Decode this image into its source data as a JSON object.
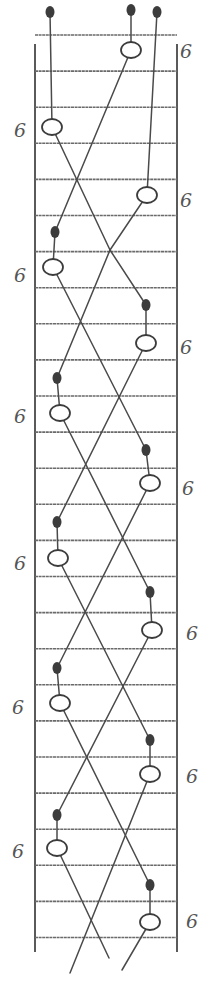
{
  "diagram": {
    "type": "ladder-crossing-diagram",
    "rung_count": 26,
    "marker_label": "6",
    "colors": {
      "ink": "#3c3c3c",
      "rail": "#5a5a5a",
      "background": "#ffffff"
    },
    "start_dots": 3,
    "stages": [
      {
        "side": "right",
        "label": "6"
      },
      {
        "side": "left",
        "label": "6"
      },
      {
        "side": "right",
        "label": "6"
      },
      {
        "side": "left",
        "label": "6"
      },
      {
        "side": "right",
        "label": "6"
      },
      {
        "side": "left",
        "label": "6"
      },
      {
        "side": "right",
        "label": "6"
      },
      {
        "side": "left",
        "label": "6"
      },
      {
        "side": "right",
        "label": "6"
      },
      {
        "side": "left",
        "label": "6"
      },
      {
        "side": "right",
        "label": "6"
      },
      {
        "side": "left",
        "label": "6"
      },
      {
        "side": "right",
        "label": "6"
      }
    ]
  }
}
